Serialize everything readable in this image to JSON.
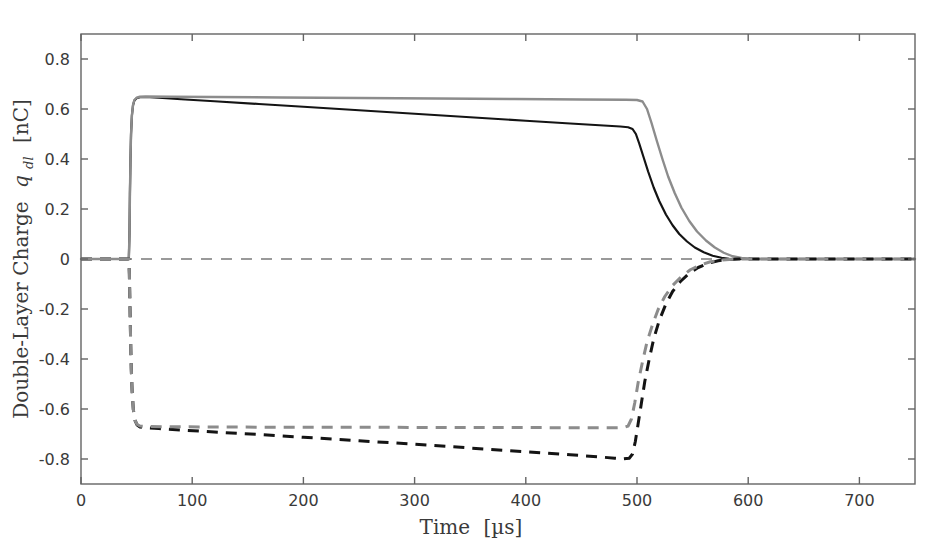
{
  "chart_data": {
    "type": "line",
    "title": "",
    "xlabel": "Time [µs]",
    "ylabel": "Double-Layer Charge q_dl [nC]",
    "ylabel_parts": {
      "main": "Double-Layer Charge",
      "symbol": "q",
      "subscript": "dl",
      "units": "[nC]"
    },
    "xlabel_parts": {
      "main": "Time",
      "units": "[µs]"
    },
    "xlim": [
      0,
      750
    ],
    "ylim": [
      -0.9,
      0.9
    ],
    "xticks": [
      0,
      100,
      200,
      300,
      400,
      500,
      600,
      700
    ],
    "xticklabels": [
      "0",
      "100",
      "200",
      "300",
      "400",
      "500",
      "600",
      "700"
    ],
    "yticks": [
      -0.8,
      -0.6,
      -0.4,
      -0.2,
      0,
      0.2,
      0.4,
      0.6,
      0.8
    ],
    "yticklabels": [
      "-0.8",
      "-0.6",
      "-0.4",
      "-0.2",
      "0",
      "0.2",
      "0.4",
      "0.6",
      "0.8"
    ],
    "grid": false,
    "legend": "none",
    "colors": {
      "black": "#141414",
      "gray": "#8c8c8c",
      "axis": "#646464",
      "zero_line": "#7a7a7a"
    },
    "annotations": [
      {
        "name": "zero-reference-line",
        "y": 0,
        "style": "dashed",
        "color": "#7a7a7a"
      }
    ],
    "series": [
      {
        "name": "anode-charge-black-solid",
        "color": "#141414",
        "style": "solid",
        "width": 2.2,
        "points": [
          [
            0,
            0
          ],
          [
            20,
            0
          ],
          [
            40,
            0
          ],
          [
            43,
            0
          ],
          [
            43.6,
            0.1
          ],
          [
            44.0,
            0.26
          ],
          [
            44.5,
            0.4
          ],
          [
            45.0,
            0.5
          ],
          [
            45.8,
            0.575
          ],
          [
            46.8,
            0.615
          ],
          [
            48.0,
            0.634
          ],
          [
            50.0,
            0.643
          ],
          [
            53,
            0.647
          ],
          [
            58,
            0.648
          ],
          [
            70,
            0.645
          ],
          [
            90,
            0.639
          ],
          [
            120,
            0.631
          ],
          [
            160,
            0.62
          ],
          [
            200,
            0.609
          ],
          [
            250,
            0.595
          ],
          [
            300,
            0.581
          ],
          [
            350,
            0.567
          ],
          [
            400,
            0.553
          ],
          [
            440,
            0.542
          ],
          [
            470,
            0.534
          ],
          [
            485,
            0.53
          ],
          [
            492,
            0.527
          ],
          [
            496,
            0.52
          ],
          [
            499,
            0.5
          ],
          [
            502,
            0.462
          ],
          [
            506,
            0.406
          ],
          [
            510,
            0.35
          ],
          [
            515,
            0.286
          ],
          [
            520,
            0.232
          ],
          [
            526,
            0.178
          ],
          [
            532,
            0.135
          ],
          [
            538,
            0.1
          ],
          [
            545,
            0.07
          ],
          [
            552,
            0.046
          ],
          [
            560,
            0.027
          ],
          [
            568,
            0.013
          ],
          [
            576,
            0.005
          ],
          [
            583,
            0.001
          ],
          [
            590,
            0.0
          ],
          [
            620,
            0
          ],
          [
            680,
            0
          ],
          [
            750,
            0
          ]
        ]
      },
      {
        "name": "anode-charge-gray-solid",
        "color": "#8c8c8c",
        "style": "solid",
        "width": 2.4,
        "points": [
          [
            0,
            0
          ],
          [
            20,
            0
          ],
          [
            40,
            0
          ],
          [
            43,
            0
          ],
          [
            43.6,
            0.1
          ],
          [
            44.0,
            0.26
          ],
          [
            44.5,
            0.4
          ],
          [
            45.0,
            0.5
          ],
          [
            45.8,
            0.575
          ],
          [
            46.8,
            0.617
          ],
          [
            48.0,
            0.636
          ],
          [
            50.0,
            0.645
          ],
          [
            53,
            0.649
          ],
          [
            58,
            0.65
          ],
          [
            80,
            0.649
          ],
          [
            120,
            0.648
          ],
          [
            180,
            0.646
          ],
          [
            250,
            0.644
          ],
          [
            320,
            0.642
          ],
          [
            390,
            0.64
          ],
          [
            450,
            0.638
          ],
          [
            490,
            0.637
          ],
          [
            500,
            0.636
          ],
          [
            505,
            0.63
          ],
          [
            509,
            0.6
          ],
          [
            513,
            0.545
          ],
          [
            518,
            0.47
          ],
          [
            523,
            0.398
          ],
          [
            528,
            0.33
          ],
          [
            534,
            0.263
          ],
          [
            540,
            0.205
          ],
          [
            547,
            0.152
          ],
          [
            554,
            0.11
          ],
          [
            562,
            0.074
          ],
          [
            570,
            0.046
          ],
          [
            578,
            0.025
          ],
          [
            586,
            0.011
          ],
          [
            594,
            0.004
          ],
          [
            602,
            0.001
          ],
          [
            612,
            0
          ],
          [
            680,
            0
          ],
          [
            750,
            0
          ]
        ]
      },
      {
        "name": "cathode-charge-black-dashed",
        "color": "#141414",
        "style": "dashed",
        "width": 3.0,
        "points": [
          [
            0,
            0
          ],
          [
            20,
            0
          ],
          [
            40,
            0
          ],
          [
            43,
            0
          ],
          [
            43.5,
            -0.06
          ],
          [
            44.0,
            -0.18
          ],
          [
            44.6,
            -0.32
          ],
          [
            45.2,
            -0.44
          ],
          [
            46.0,
            -0.53
          ],
          [
            47.0,
            -0.6
          ],
          [
            48.5,
            -0.645
          ],
          [
            50.5,
            -0.664
          ],
          [
            53,
            -0.672
          ],
          [
            58,
            -0.675
          ],
          [
            70,
            -0.678
          ],
          [
            90,
            -0.684
          ],
          [
            120,
            -0.692
          ],
          [
            160,
            -0.702
          ],
          [
            200,
            -0.713
          ],
          [
            250,
            -0.727
          ],
          [
            300,
            -0.741
          ],
          [
            350,
            -0.756
          ],
          [
            400,
            -0.771
          ],
          [
            440,
            -0.783
          ],
          [
            465,
            -0.791
          ],
          [
            480,
            -0.797
          ],
          [
            488,
            -0.799
          ],
          [
            493,
            -0.797
          ],
          [
            496,
            -0.78
          ],
          [
            498.5,
            -0.73
          ],
          [
            501,
            -0.66
          ],
          [
            504,
            -0.575
          ],
          [
            507,
            -0.49
          ],
          [
            511,
            -0.4
          ],
          [
            515,
            -0.32
          ],
          [
            520,
            -0.246
          ],
          [
            526,
            -0.18
          ],
          [
            532,
            -0.13
          ],
          [
            539,
            -0.09
          ],
          [
            547,
            -0.057
          ],
          [
            555,
            -0.034
          ],
          [
            564,
            -0.017
          ],
          [
            573,
            -0.007
          ],
          [
            582,
            -0.002
          ],
          [
            592,
            0
          ],
          [
            650,
            0
          ],
          [
            750,
            0
          ]
        ]
      },
      {
        "name": "cathode-charge-gray-dashed",
        "color": "#8c8c8c",
        "style": "dashed",
        "width": 3.0,
        "points": [
          [
            0,
            0
          ],
          [
            20,
            0
          ],
          [
            40,
            0
          ],
          [
            43,
            0
          ],
          [
            43.5,
            -0.06
          ],
          [
            44.0,
            -0.18
          ],
          [
            44.6,
            -0.32
          ],
          [
            45.2,
            -0.44
          ],
          [
            46.0,
            -0.53
          ],
          [
            47.0,
            -0.6
          ],
          [
            48.5,
            -0.645
          ],
          [
            50.5,
            -0.662
          ],
          [
            53,
            -0.668
          ],
          [
            58,
            -0.67
          ],
          [
            80,
            -0.671
          ],
          [
            120,
            -0.672
          ],
          [
            180,
            -0.673
          ],
          [
            250,
            -0.673
          ],
          [
            320,
            -0.674
          ],
          [
            390,
            -0.674
          ],
          [
            450,
            -0.675
          ],
          [
            480,
            -0.675
          ],
          [
            488,
            -0.674
          ],
          [
            492,
            -0.668
          ],
          [
            495,
            -0.64
          ],
          [
            498,
            -0.575
          ],
          [
            501,
            -0.495
          ],
          [
            505,
            -0.41
          ],
          [
            509,
            -0.332
          ],
          [
            514,
            -0.262
          ],
          [
            519,
            -0.202
          ],
          [
            525,
            -0.15
          ],
          [
            532,
            -0.106
          ],
          [
            540,
            -0.07
          ],
          [
            548,
            -0.043
          ],
          [
            557,
            -0.024
          ],
          [
            566,
            -0.011
          ],
          [
            576,
            -0.004
          ],
          [
            586,
            -0.001
          ],
          [
            598,
            0
          ],
          [
            660,
            0
          ],
          [
            750,
            0
          ]
        ]
      }
    ]
  }
}
